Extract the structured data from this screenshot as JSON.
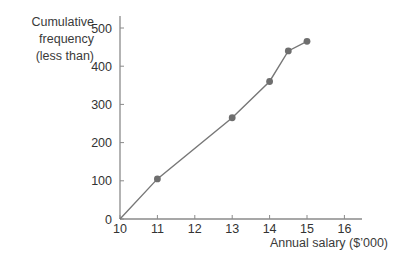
{
  "chart_data": {
    "type": "line",
    "title": "",
    "xlabel": "Annual salary ($’000)",
    "ylabel": [
      "Cumulative",
      "frequency",
      "(less than)"
    ],
    "x": [
      10,
      11,
      13,
      14,
      14.5,
      15
    ],
    "values": [
      0,
      105,
      265,
      360,
      440,
      465
    ],
    "series": [
      {
        "name": "Cumulative frequency",
        "x": [
          10,
          11,
          13,
          14,
          14.5,
          15
        ],
        "values": [
          0,
          105,
          265,
          360,
          440,
          465
        ],
        "markers_at": [
          11,
          13,
          14,
          14.5,
          15
        ]
      }
    ],
    "xticks": [
      10,
      11,
      12,
      13,
      14,
      15,
      16
    ],
    "yticks": [
      0,
      100,
      200,
      300,
      400,
      500
    ],
    "xlim": [
      10,
      16.5
    ],
    "ylim": [
      0,
      530
    ],
    "grid": false,
    "legend": "none",
    "colors": {
      "line": "#777777",
      "marker": "#6e6e6e",
      "axis": "#8a8a8a",
      "text": "#333333"
    }
  }
}
